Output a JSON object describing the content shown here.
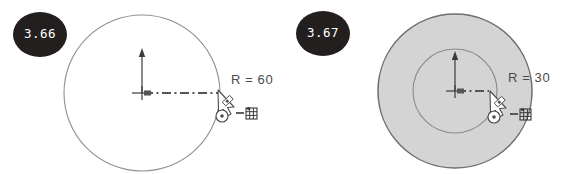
{
  "canvas": {
    "width": 564,
    "height": 174,
    "background_color": "#ffffff"
  },
  "palette": {
    "badge_fill": "#231f1e",
    "badge_text": "#ffffff",
    "geometry_stroke": "#8a8a8a",
    "shape_fill": "#d4d4d4",
    "shape_stroke": "#6e6e6e",
    "dimension_line": "#555555",
    "axis_color": "#3b3b3b",
    "label_text": "#4a4a4a",
    "cursor_fill": "#ffffff",
    "cursor_stroke": "#4d4d4d"
  },
  "panels": [
    {
      "id": "panel-left",
      "step_badge": {
        "label": "3.66",
        "icon": "step-number-badge"
      },
      "radius_label": "R = 60",
      "shape": {
        "kind": "circle-preview",
        "filled": false,
        "center": {
          "x": 142,
          "y": 93
        },
        "radius": 78
      },
      "origin_axis": {
        "up_arrow": true,
        "tick_marks": true
      },
      "dimension_line": {
        "style": "dash-dot",
        "from_x": 142,
        "to_x": 220,
        "y": 93
      },
      "cursor": {
        "icon": "circle-tool-cursor",
        "x": 220,
        "y": 93
      },
      "snap_indicator": {
        "icon": "grid-snap-icon",
        "x": 248,
        "y": 113
      }
    },
    {
      "id": "panel-right",
      "step_badge": {
        "label": "3.67",
        "icon": "step-number-badge"
      },
      "radius_label": "R = 30",
      "shape": {
        "kind": "circle-filled",
        "filled": true,
        "center": {
          "x": 173,
          "y": 91
        },
        "radius": 77
      },
      "inner_preview": {
        "kind": "circle-preview",
        "center": {
          "x": 173,
          "y": 91
        },
        "radius": 42
      },
      "origin_axis": {
        "up_arrow": true,
        "tick_marks": true
      },
      "dimension_line": {
        "style": "dash-dot",
        "from_x": 173,
        "to_x": 207,
        "y": 91
      },
      "cursor": {
        "icon": "circle-tool-cursor",
        "x": 210,
        "y": 95
      },
      "snap_indicator": {
        "icon": "grid-snap-icon",
        "x": 240,
        "y": 114
      }
    }
  ]
}
